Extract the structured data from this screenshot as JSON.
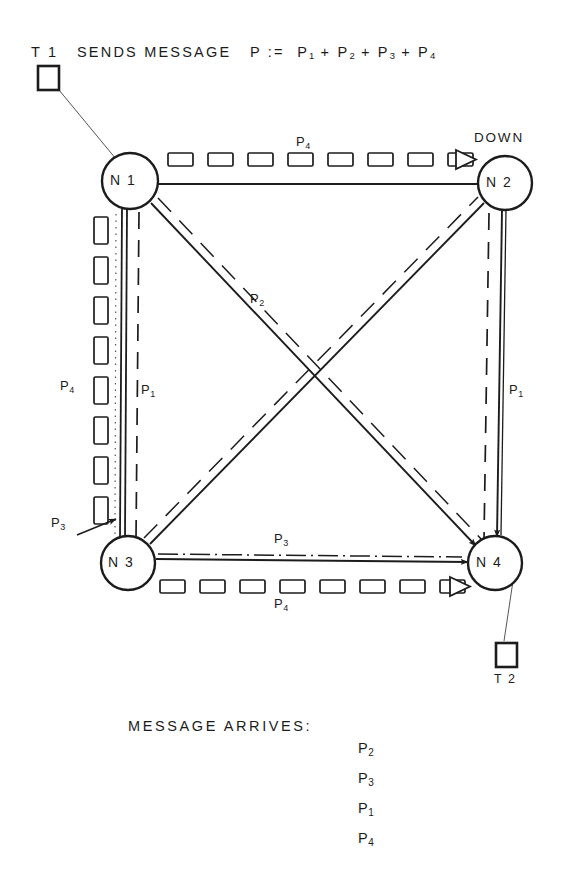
{
  "diagram": {
    "title_line": {
      "prefix": "T 1",
      "text": "SENDS MESSAGE",
      "equation_lhs": "P",
      "assign": ":=",
      "terms": [
        "P1",
        "P2",
        "P3",
        "P4"
      ],
      "full": "T 1  SENDS MESSAGE  P := P1 + P2 + P3 + P4"
    },
    "terminals": [
      {
        "id": "T1",
        "label": "T 1",
        "x": 48,
        "y": 78,
        "attached_node": "N1"
      },
      {
        "id": "T2",
        "label": "T 2",
        "x": 506,
        "y": 655,
        "attached_node": "N4"
      }
    ],
    "nodes": [
      {
        "id": "N1",
        "label": "N 1",
        "cx": 130,
        "cy": 181,
        "r": 28,
        "status": ""
      },
      {
        "id": "N2",
        "label": "N 2",
        "cx": 505,
        "cy": 183,
        "r": 27,
        "status": "DOWN"
      },
      {
        "id": "N3",
        "label": "N 3",
        "cx": 128,
        "cy": 563,
        "r": 27,
        "status": ""
      },
      {
        "id": "N4",
        "label": "N 4",
        "cx": 495,
        "cy": 563,
        "r": 27,
        "status": ""
      }
    ],
    "edges": [
      {
        "id": "n1-n2",
        "from": "N1",
        "to": "N2",
        "label": "P4",
        "label_x": 296,
        "label_y": 138,
        "style": "queued-packets",
        "terminator": "blocked-triangle",
        "packet_count": 8
      },
      {
        "id": "n1-n3",
        "from": "N1",
        "to": "N3",
        "label": "P4",
        "label_x": 62,
        "label_y": 383,
        "style": "queued-packets",
        "terminator": "none",
        "packet_count": 8
      },
      {
        "id": "n1-n3-line",
        "from": "N1",
        "to": "N3",
        "label": "P1",
        "label_x": 141,
        "label_y": 386,
        "style": "dashed-pair",
        "terminator": "none"
      },
      {
        "id": "n3-left-in",
        "from": "",
        "to": "N3",
        "label": "P3",
        "label_x": 53,
        "label_y": 520,
        "style": "callout-arrow",
        "terminator": "arrow"
      },
      {
        "id": "n1-n4",
        "from": "N1",
        "to": "N4",
        "label": "P2",
        "label_x": 251,
        "label_y": 296,
        "style": "dashed-pair",
        "terminator": "arrow"
      },
      {
        "id": "n3-n2",
        "from": "N3",
        "to": "N2",
        "label": "",
        "label_x": 0,
        "label_y": 0,
        "style": "dashed-pair",
        "terminator": "none"
      },
      {
        "id": "n2-n4",
        "from": "N2",
        "to": "N4",
        "label": "P1",
        "label_x": 510,
        "label_y": 386,
        "style": "dashed-pair",
        "terminator": "arrow"
      },
      {
        "id": "n3-n4",
        "from": "N3",
        "to": "N4",
        "label": "P3",
        "label_x": 276,
        "label_y": 537,
        "style": "dash-dot",
        "terminator": "arrow"
      },
      {
        "id": "n3-n4-packets",
        "from": "N3",
        "to": "N4",
        "label": "P4",
        "label_x": 276,
        "label_y": 594,
        "style": "queued-packets",
        "terminator": "blocked-triangle",
        "packet_count": 8
      }
    ],
    "arrival_block": {
      "title": "MESSAGE  ARRIVES:",
      "items": [
        "P2",
        "P3",
        "P1",
        "P4"
      ],
      "items_x": 360,
      "items_y_start": 744,
      "items_line_height": 30
    },
    "colors": {
      "ink": "#1c1c1c",
      "line": "#262626",
      "background": "#ffffff",
      "thin_line": "#555555"
    }
  }
}
